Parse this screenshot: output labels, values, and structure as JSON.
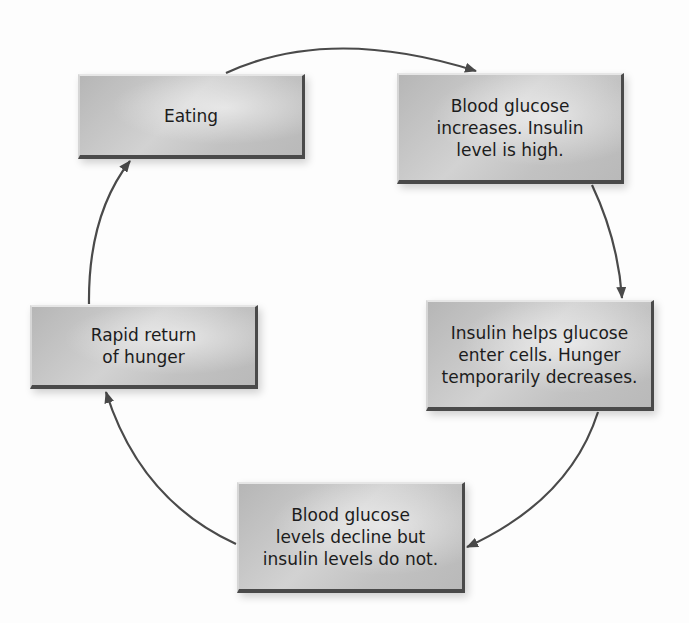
{
  "diagram": {
    "type": "cycle",
    "nodes": [
      {
        "id": "eating",
        "label": "Eating"
      },
      {
        "id": "glucose_up",
        "label": "Blood glucose\nincreases. Insulin\nlevel is high."
      },
      {
        "id": "insulin_helps",
        "label": "Insulin helps glucose\nenter cells. Hunger\ntemporarily decreases."
      },
      {
        "id": "glucose_decline",
        "label": "Blood glucose\nlevels decline but\ninsulin levels do not."
      },
      {
        "id": "hunger_returns",
        "label": "Rapid return\nof hunger"
      }
    ],
    "edges": [
      {
        "from": "eating",
        "to": "glucose_up"
      },
      {
        "from": "glucose_up",
        "to": "insulin_helps"
      },
      {
        "from": "insulin_helps",
        "to": "glucose_decline"
      },
      {
        "from": "glucose_decline",
        "to": "hunger_returns"
      },
      {
        "from": "hunger_returns",
        "to": "eating"
      }
    ],
    "colors": {
      "box_fill": "#c4c4c4",
      "box_edge_dark": "#4a4a4a",
      "arrow": "#4a4a4a",
      "background": "#fdfdfd",
      "text": "#1c1c1c"
    }
  }
}
